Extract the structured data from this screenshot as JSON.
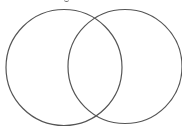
{
  "diagram": {
    "type": "venn",
    "background": "#ffffff",
    "stroke_color": "#555555",
    "stroke_width": 1.2,
    "circles": [
      {
        "name": "left-set",
        "cx": 64,
        "cy": 67.5,
        "r": 58,
        "label": ""
      },
      {
        "name": "right-set",
        "cx": 125,
        "cy": 66.5,
        "r": 57,
        "label": ""
      }
    ],
    "intersection_label": "",
    "title_fragment_visible": true
  }
}
